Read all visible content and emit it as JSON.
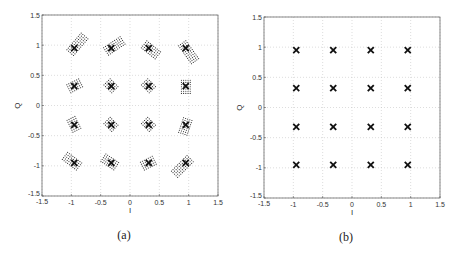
{
  "chart_data": [
    {
      "type": "scatter",
      "panel": "(a)",
      "title": "",
      "xlabel": "I",
      "ylabel": "Q",
      "xlim": [
        -1.5,
        1.5
      ],
      "ylim": [
        -1.5,
        1.5
      ],
      "xticks": [
        "-1.5",
        "-1",
        "-0.5",
        "0",
        "0.5",
        "1",
        "1.5"
      ],
      "yticks": [
        "-1.5",
        "-1",
        "-0.5",
        "0",
        "0.5",
        "1",
        "1.5"
      ],
      "grid": true,
      "legend": null,
      "series": [
        {
          "name": "16-QAM ideal constellation points",
          "marker": "x",
          "points": [
            [
              -0.95,
              0.95
            ],
            [
              -0.32,
              0.95
            ],
            [
              0.32,
              0.95
            ],
            [
              0.95,
              0.95
            ],
            [
              -0.95,
              0.32
            ],
            [
              -0.32,
              0.32
            ],
            [
              0.32,
              0.32
            ],
            [
              0.95,
              0.32
            ],
            [
              -0.95,
              -0.32
            ],
            [
              -0.32,
              -0.32
            ],
            [
              0.32,
              -0.32
            ],
            [
              0.95,
              -0.32
            ],
            [
              -0.95,
              -0.95
            ],
            [
              -0.32,
              -0.95
            ],
            [
              0.32,
              -0.95
            ],
            [
              0.95,
              -0.95
            ]
          ]
        },
        {
          "name": "received samples (dotted rectangular clusters offset diagonally)",
          "marker": "dot-cluster",
          "clusters": [
            {
              "center": [
                -0.95,
                0.95
              ],
              "dx": 0.12,
              "dy": 0.14
            },
            {
              "center": [
                -0.32,
                0.95
              ],
              "dx": 0.12,
              "dy": 0.08
            },
            {
              "center": [
                0.32,
                0.95
              ],
              "dx": 0.1,
              "dy": -0.08
            },
            {
              "center": [
                0.95,
                0.95
              ],
              "dx": 0.1,
              "dy": -0.14
            },
            {
              "center": [
                -0.95,
                0.32
              ],
              "dx": 0.04,
              "dy": 0.02
            },
            {
              "center": [
                -0.32,
                0.32
              ],
              "dx": 0.0,
              "dy": 0.0
            },
            {
              "center": [
                0.32,
                0.32
              ],
              "dx": 0.0,
              "dy": 0.0
            },
            {
              "center": [
                0.95,
                0.32
              ],
              "dx": 0.0,
              "dy": -0.04
            },
            {
              "center": [
                -0.95,
                -0.32
              ],
              "dx": -0.02,
              "dy": 0.04
            },
            {
              "center": [
                -0.32,
                -0.32
              ],
              "dx": 0.0,
              "dy": 0.0
            },
            {
              "center": [
                0.32,
                -0.32
              ],
              "dx": 0.0,
              "dy": 0.0
            },
            {
              "center": [
                0.95,
                -0.32
              ],
              "dx": -0.02,
              "dy": -0.06
            },
            {
              "center": [
                -0.95,
                -0.95
              ],
              "dx": -0.08,
              "dy": 0.06
            },
            {
              "center": [
                -0.32,
                -0.95
              ],
              "dx": -0.06,
              "dy": 0.04
            },
            {
              "center": [
                0.32,
                -0.95
              ],
              "dx": -0.04,
              "dy": -0.02
            },
            {
              "center": [
                0.95,
                -0.95
              ],
              "dx": -0.12,
              "dy": -0.12
            }
          ]
        }
      ]
    },
    {
      "type": "scatter",
      "panel": "(b)",
      "title": "",
      "xlabel": "I",
      "ylabel": "Q",
      "xlim": [
        -1.5,
        1.5
      ],
      "ylim": [
        -1.5,
        1.5
      ],
      "xticks": [
        "-1.5",
        "-1",
        "-0.5",
        "0",
        "0.5",
        "1",
        "1.5"
      ],
      "yticks": [
        "-1.5",
        "-1",
        "-0.5",
        "0",
        "0.5",
        "1",
        "1.5"
      ],
      "grid": true,
      "legend": null,
      "series": [
        {
          "name": "16-QAM constellation points (compensated)",
          "marker": "x",
          "points": [
            [
              -0.95,
              0.95
            ],
            [
              -0.32,
              0.95
            ],
            [
              0.32,
              0.95
            ],
            [
              0.95,
              0.95
            ],
            [
              -0.95,
              0.32
            ],
            [
              -0.32,
              0.32
            ],
            [
              0.32,
              0.32
            ],
            [
              0.95,
              0.32
            ],
            [
              -0.95,
              -0.32
            ],
            [
              -0.32,
              -0.32
            ],
            [
              0.32,
              -0.32
            ],
            [
              0.95,
              -0.32
            ],
            [
              -0.95,
              -0.95
            ],
            [
              -0.32,
              -0.95
            ],
            [
              0.32,
              -0.95
            ],
            [
              0.95,
              -0.95
            ]
          ]
        }
      ]
    }
  ],
  "captions": {
    "a": "(a)",
    "b": "(b)"
  },
  "labels": {
    "x": "I",
    "y": "Q"
  }
}
